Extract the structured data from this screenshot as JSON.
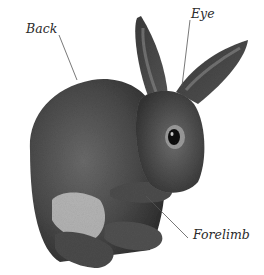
{
  "image": {
    "subject": "Rabbit",
    "labels": [
      {
        "id": "back",
        "text": "Back"
      },
      {
        "id": "eye",
        "text": "Eye"
      },
      {
        "id": "forelimb",
        "text": "Forelimb"
      }
    ]
  },
  "colors": {
    "background": "#ffffff",
    "fur_dark": "#3e3e3e",
    "fur_mid": "#5c5c5c",
    "fur_light": "#8a8a8a",
    "belly": "#c9c9c9",
    "leader_line": "#555555",
    "label_text": "#2a2a2a"
  }
}
